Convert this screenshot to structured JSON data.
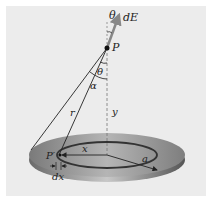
{
  "figure": {
    "labels": {
      "theta_top": "θ",
      "dE": "dE",
      "P": "P",
      "theta_mid": "θ",
      "alpha": "α",
      "r": "r",
      "y": "y",
      "P_prime": "P′",
      "x": "x",
      "a": "a",
      "dx": "dx"
    },
    "colors": {
      "background": "#ececec",
      "disk_top": "#8a8a8a",
      "disk_edge": "#555555",
      "lines": "#222222",
      "arrow": "#777777"
    }
  }
}
